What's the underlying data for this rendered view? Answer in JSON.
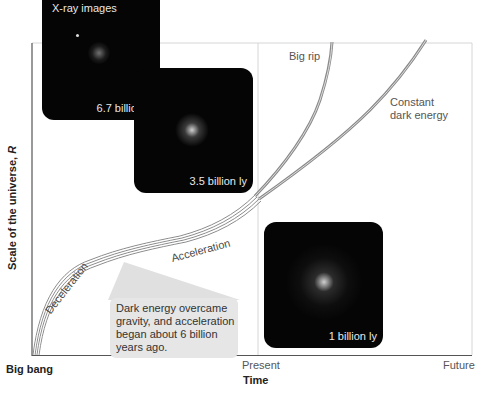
{
  "diagram": {
    "type": "universe-expansion",
    "y_axis_label": "Scale of the universe, ",
    "y_axis_label_var": "R",
    "x_axis_label": "Time",
    "x_ticks": [
      "Big bang",
      "Present",
      "Future"
    ],
    "curves": [
      {
        "name": "Big rip",
        "label": "Big rip"
      },
      {
        "name": "Constant dark energy",
        "label_line1": "Constant",
        "label_line2": "dark energy"
      }
    ],
    "segment_labels": {
      "deceleration": "Deceleration",
      "acceleration": "Acceleration"
    },
    "callout": {
      "lines": [
        "Dark energy overcame",
        "gravity, and acceleration",
        "began about 6 billion",
        "years ago."
      ]
    },
    "images": {
      "title": "X-ray images",
      "cards": [
        {
          "caption": "6.7 billion ly"
        },
        {
          "caption": "3.5 billion ly"
        },
        {
          "caption": "1 billion ly"
        }
      ]
    },
    "colors": {
      "curve": "#8a8a8a",
      "axis": "#555555",
      "frame": "#d0d0d0",
      "card_bg": "#050505",
      "callout_bg": "#e6e6e6"
    }
  }
}
